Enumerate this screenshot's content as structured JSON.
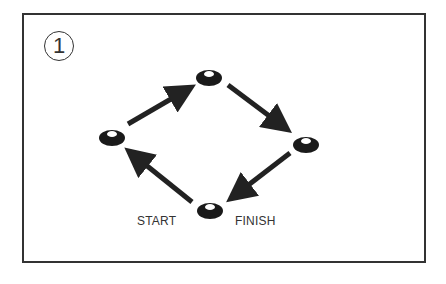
{
  "diagram": {
    "step_number": "1",
    "labels": {
      "start": "START",
      "finish": "FINISH"
    },
    "colors": {
      "frame": "#333333",
      "cone": "#1a1a1a",
      "arrow": "#222222",
      "text": "#333333"
    },
    "cones": [
      {
        "name": "left",
        "x": 112,
        "y": 136
      },
      {
        "name": "top",
        "x": 209,
        "y": 76
      },
      {
        "name": "right",
        "x": 306,
        "y": 143
      },
      {
        "name": "bottom",
        "x": 210,
        "y": 209
      }
    ],
    "arrows": [
      {
        "from": "left",
        "to": "top"
      },
      {
        "from": "top",
        "to": "right"
      },
      {
        "from": "right",
        "to": "bottom"
      },
      {
        "from": "bottom",
        "to": "left"
      }
    ]
  }
}
